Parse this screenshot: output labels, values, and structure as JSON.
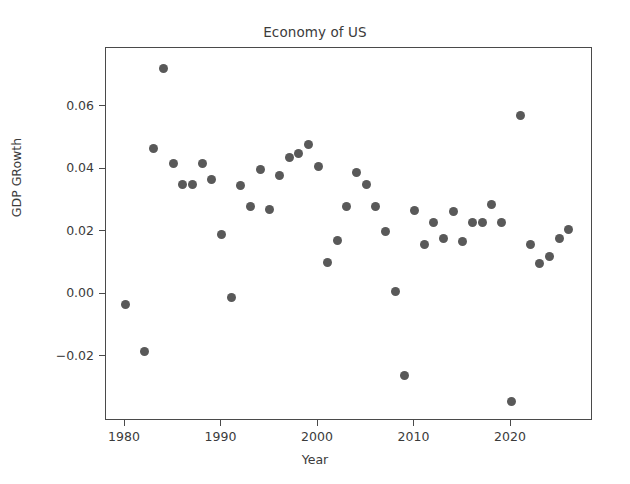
{
  "chart_data": {
    "type": "scatter",
    "title": "Economy of US",
    "xlabel": "Year",
    "ylabel": "GDP GRowth",
    "xlim": [
      1978.2,
      1983.5
    ],
    "ylim": [
      -0.0345,
      0.0795
    ],
    "xticks": [
      1980,
      1990,
      2000,
      2010,
      2020
    ],
    "xticklabels": [
      "1980",
      "1990",
      "2000",
      "2010",
      "2020"
    ],
    "yticks": [
      -0.02,
      0.0,
      0.02,
      0.04,
      0.06
    ],
    "yticklabels": [
      "−0.02",
      "0.00",
      "0.02",
      "0.04",
      "0.06"
    ],
    "grid": false,
    "legend": null,
    "marker": {
      "shape": "circle",
      "color": "#595959",
      "size_px": 9
    },
    "x": [
      1980,
      1982,
      1983,
      1984,
      1985,
      1986,
      1987,
      1988,
      1989,
      1990,
      1991,
      1992,
      1993,
      1994,
      1995,
      1996,
      1997,
      1998,
      1999,
      2000,
      2001,
      2002,
      2003,
      2004,
      2005,
      2006,
      2007,
      2008,
      2009,
      2010,
      2011,
      2012,
      2013,
      2014,
      2015,
      2016,
      2017,
      2018,
      2019,
      2020,
      2021,
      2022,
      2023,
      2024,
      2025,
      2026
    ],
    "y": [
      -0.0035,
      -0.0184,
      0.0465,
      0.0722,
      0.0418,
      0.035,
      0.0349,
      0.0418,
      0.0368,
      0.019,
      -0.001,
      0.0348,
      0.0279,
      0.04,
      0.0269,
      0.0378,
      0.0436,
      0.0449,
      0.0477,
      0.0408,
      0.01,
      0.017,
      0.0279,
      0.0388,
      0.035,
      0.0279,
      0.0199,
      0.0008,
      -0.0262,
      0.0266,
      0.0158,
      0.0229,
      0.0178,
      0.0264,
      0.0169,
      0.0229,
      0.0229,
      0.0288,
      0.0229,
      -0.0345,
      0.057,
      0.0159,
      0.0098,
      0.0119,
      0.0178,
      0.0208
    ],
    "series_name": "GDP GRowth"
  },
  "axis": {
    "x_pixel_origin": 124,
    "x_pixels_per_decade": 96.5,
    "y_pixel_zero": 293,
    "y_pixels_per_002": 62.5
  }
}
